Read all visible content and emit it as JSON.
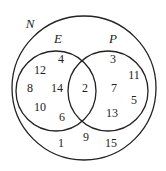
{
  "diagram": {
    "type": "venn",
    "universal_label": "N",
    "sets": [
      {
        "label": "E",
        "only": [
          "12",
          "4",
          "8",
          "14",
          "10",
          "6"
        ]
      },
      {
        "label": "P",
        "only": [
          "3",
          "11",
          "7",
          "5",
          "13"
        ]
      }
    ],
    "intersection": [
      "2"
    ],
    "outside": [
      "1",
      "9",
      "15"
    ]
  },
  "labels": {
    "N": "N",
    "E": "E",
    "P": "P"
  },
  "numbers": {
    "n12": "12",
    "n4": "4",
    "n8": "8",
    "n14": "14",
    "n10": "10",
    "n6": "6",
    "n2": "2",
    "n3": "3",
    "n11": "11",
    "n7": "7",
    "n5": "5",
    "n13": "13",
    "n1": "1",
    "n9": "9",
    "n15": "15"
  }
}
